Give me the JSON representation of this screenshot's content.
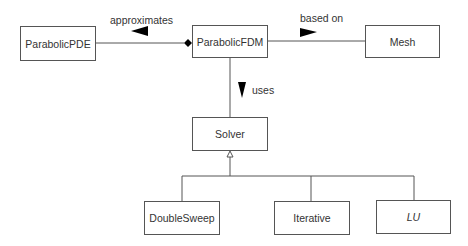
{
  "diagram": {
    "type": "uml-class-diagram",
    "classes": [
      {
        "id": "parabolic_pde",
        "name": "ParabolicPDE",
        "abstract": false
      },
      {
        "id": "parabolic_fdm",
        "name": "ParabolicFDM",
        "abstract": false
      },
      {
        "id": "mesh",
        "name": "Mesh",
        "abstract": false
      },
      {
        "id": "solver",
        "name": "Solver",
        "abstract": false
      },
      {
        "id": "double_sweep",
        "name": "DoubleSweep",
        "abstract": false
      },
      {
        "id": "iterative",
        "name": "Iterative",
        "abstract": false
      },
      {
        "id": "lu",
        "name": "LU",
        "abstract": true
      }
    ],
    "relations": [
      {
        "from": "ParabolicFDM",
        "to": "ParabolicPDE",
        "kind": "composition",
        "label": "approximates",
        "direction_arrow": "left"
      },
      {
        "from": "ParabolicFDM",
        "to": "Mesh",
        "kind": "association",
        "label": "based on",
        "direction_arrow": "right"
      },
      {
        "from": "ParabolicFDM",
        "to": "Solver",
        "kind": "association",
        "label": "uses",
        "direction_arrow": "down"
      },
      {
        "from": "DoubleSweep",
        "to": "Solver",
        "kind": "generalization"
      },
      {
        "from": "Iterative",
        "to": "Solver",
        "kind": "generalization"
      },
      {
        "from": "LU",
        "to": "Solver",
        "kind": "generalization"
      }
    ],
    "labels": {
      "approximates": "approximates",
      "based_on": "based on",
      "uses": "uses"
    },
    "colors": {
      "line": "#555555",
      "text": "#333333",
      "fill": "#000000"
    }
  }
}
